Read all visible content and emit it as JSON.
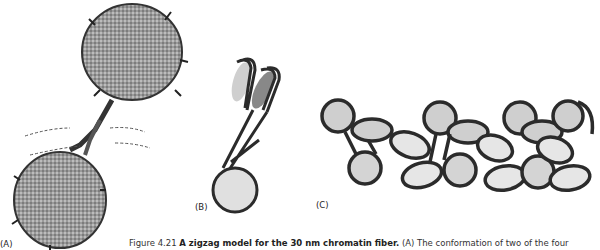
{
  "figure": {
    "panels": [
      {
        "id": "A",
        "label": "(A)",
        "description": "Atomic structure of two nucleosomes joined by linker DNA"
      },
      {
        "id": "B",
        "label": "(B)",
        "description": "Schematic of nucleosomes in zigzag arrangement"
      },
      {
        "id": "C",
        "label": "(C)",
        "description": "Zigzag model of chromatin fiber with many nucleosomes"
      }
    ],
    "caption": {
      "number": "Figure 4.21",
      "title": "A zigzag model for the 30 nm chromatin fiber.",
      "text": "(A) The conformation of two of the four"
    }
  },
  "colors": {
    "disc_fill": "#cfcfcf",
    "disc_light": "#e6e6e6",
    "dna_stroke": "#2b2b2b",
    "dashed": "#555555"
  }
}
